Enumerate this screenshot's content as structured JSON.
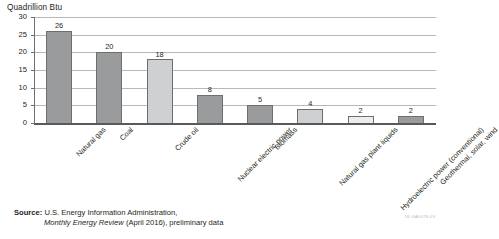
{
  "chart_data": {
    "type": "bar",
    "title": "Quadrillion Btu",
    "xlabel": "",
    "ylabel": "Quadrillion Btu",
    "ylim": [
      0,
      30
    ],
    "yticks": [
      0,
      5,
      10,
      15,
      20,
      25,
      30
    ],
    "ytick_labels": [
      "0",
      "5",
      "10",
      "15",
      "20",
      "25",
      "30"
    ],
    "grid": true,
    "legend": "none",
    "categories": [
      "Natural gas",
      "Coal",
      "Crude oil",
      "Nuclear electric power",
      "Biomass",
      "Natural gas plant liquids",
      "Hydroelectric power (conventional)",
      "Geothermal, solar, wind"
    ],
    "values": [
      26,
      20,
      18,
      8,
      5,
      4,
      2,
      2
    ],
    "value_labels": [
      "26",
      "20",
      "18",
      "8",
      "5",
      "4",
      "2",
      "2"
    ],
    "bar_tones": [
      "dark",
      "dark",
      "light",
      "dark",
      "dark",
      "light",
      "pale",
      "dark"
    ]
  },
  "colors": {
    "bar_dark": "#9a9b9d",
    "bar_light": "#cfd0d1",
    "bar_pale": "#ededee",
    "bar_outline": "#6d6e70",
    "gridline": "#b6b8ba",
    "axis": "#58595b",
    "text": "#231f20"
  },
  "source": {
    "label": "Source:",
    "line1": "U.S. Energy Information Administration,",
    "line2_italic": "Monthly Energy Review",
    "line2_rest": " (April 2016), preliminary data"
  },
  "footer": {
    "code": "18-GA0079-03"
  }
}
